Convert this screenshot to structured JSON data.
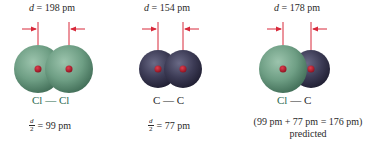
{
  "colors": {
    "chlorine": "#6e9e84",
    "carbon": "#3c3b55",
    "nucleus": "#b0182a",
    "arrow": "#d8283a"
  },
  "panels": [
    {
      "id": "cl-cl",
      "distance_var": "d",
      "distance_text": " = 198 pm",
      "bond_label": "Cl — Cl",
      "half_num": "d",
      "half_den": "2",
      "half_value": " = 99 pm",
      "atoms": [
        "chlorine",
        "chlorine"
      ]
    },
    {
      "id": "c-c",
      "distance_var": "d",
      "distance_text": " = 154 pm",
      "bond_label": "C — C",
      "half_num": "d",
      "half_den": "2",
      "half_value": " = 77 pm",
      "atoms": [
        "carbon",
        "carbon"
      ]
    },
    {
      "id": "cl-c",
      "distance_var": "d",
      "distance_text": " = 178 pm",
      "bond_label_1": "Cl",
      "bond_label_2": " — C",
      "prediction": "(99 pm + 77 pm = 176 pm)",
      "prediction_label": "predicted",
      "atoms": [
        "chlorine",
        "carbon"
      ]
    }
  ]
}
